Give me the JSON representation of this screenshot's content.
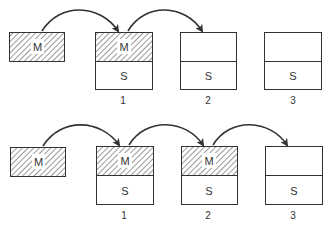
{
  "rows": [
    {
      "source": {
        "label": "M"
      },
      "slots": [
        {
          "number": "1",
          "top": "M",
          "bottom": "S",
          "top_hatched": true
        },
        {
          "number": "2",
          "top": "",
          "bottom": "S",
          "top_hatched": false
        },
        {
          "number": "3",
          "top": "",
          "bottom": "S",
          "top_hatched": false
        }
      ],
      "arrows": [
        "source→1",
        "1→2"
      ]
    },
    {
      "source": {
        "label": "M"
      },
      "slots": [
        {
          "number": "1",
          "top": "M",
          "bottom": "S",
          "top_hatched": true
        },
        {
          "number": "2",
          "top": "M",
          "bottom": "S",
          "top_hatched": true
        },
        {
          "number": "3",
          "top": "",
          "bottom": "S",
          "top_hatched": false
        }
      ],
      "arrows": [
        "source→1",
        "1→2",
        "2→3"
      ]
    }
  ]
}
